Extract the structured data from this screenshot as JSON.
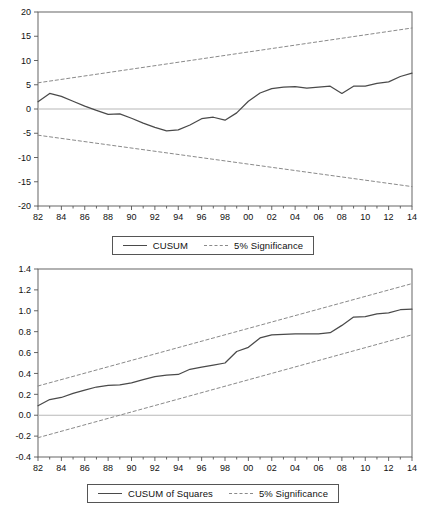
{
  "chart_data": [
    {
      "id": "cusum",
      "type": "line",
      "title": "",
      "xlabel": "",
      "ylabel": "",
      "xlim": [
        1982,
        2014
      ],
      "ylim": [
        -20,
        20
      ],
      "yticks": [
        "20",
        "15",
        "10",
        "5",
        "0",
        "-5",
        "-10",
        "-15",
        "-20"
      ],
      "ytick_values": [
        20,
        15,
        10,
        5,
        0,
        -5,
        -10,
        -15,
        -20
      ],
      "xticks": [
        "82",
        "84",
        "86",
        "88",
        "90",
        "92",
        "94",
        "96",
        "98",
        "00",
        "02",
        "04",
        "06",
        "08",
        "10",
        "12",
        "14"
      ],
      "xtick_values": [
        1982,
        1984,
        1986,
        1988,
        1990,
        1992,
        1994,
        1996,
        1998,
        2000,
        2002,
        2004,
        2006,
        2008,
        2010,
        2012,
        2014
      ],
      "grid": false,
      "zero_line": 0,
      "legend_position": "bottom",
      "series": [
        {
          "name": "CUSUM",
          "style": "solid",
          "color": "#4a4a4a",
          "x": [
            1982,
            1983,
            1984,
            1985,
            1986,
            1987,
            1988,
            1989,
            1990,
            1991,
            1992,
            1993,
            1994,
            1995,
            1996,
            1997,
            1998,
            1999,
            2000,
            2001,
            2002,
            2003,
            2004,
            2005,
            2006,
            2007,
            2008,
            2009,
            2010,
            2011,
            2012,
            2013,
            2014
          ],
          "values": [
            1.5,
            3.2,
            2.6,
            1.6,
            0.6,
            -0.3,
            -1.1,
            -1.0,
            -1.9,
            -2.9,
            -3.8,
            -4.5,
            -4.3,
            -3.3,
            -2.0,
            -1.7,
            -2.3,
            -0.8,
            1.6,
            3.3,
            4.2,
            4.5,
            4.6,
            4.3,
            4.5,
            4.7,
            3.2,
            4.7,
            4.7,
            5.3,
            5.6,
            6.7,
            7.4
          ]
        },
        {
          "name": "5% Significance",
          "style": "dashed",
          "color": "#8a8a8a",
          "x": [
            1982,
            2014
          ],
          "values": [
            5.4,
            16.7
          ]
        },
        {
          "name": "5% Significance",
          "style": "dashed",
          "color": "#8a8a8a",
          "x": [
            1982,
            2014
          ],
          "values": [
            -5.4,
            -16.0
          ]
        }
      ],
      "legend": [
        {
          "label": "CUSUM",
          "style": "solid"
        },
        {
          "label": "5% Significance",
          "style": "dashed"
        }
      ]
    },
    {
      "id": "cusum-squares",
      "type": "line",
      "title": "",
      "xlabel": "",
      "ylabel": "",
      "xlim": [
        1982,
        2014
      ],
      "ylim": [
        -0.4,
        1.4
      ],
      "yticks": [
        "1.4",
        "1.2",
        "1.0",
        "0.8",
        "0.6",
        "0.4",
        "0.2",
        "0.0",
        "-0.2",
        "-0.4"
      ],
      "ytick_values": [
        1.4,
        1.2,
        1.0,
        0.8,
        0.6,
        0.4,
        0.2,
        0.0,
        -0.2,
        -0.4
      ],
      "xticks": [
        "82",
        "84",
        "86",
        "88",
        "90",
        "92",
        "94",
        "96",
        "98",
        "00",
        "02",
        "04",
        "06",
        "08",
        "10",
        "12",
        "14"
      ],
      "xtick_values": [
        1982,
        1984,
        1986,
        1988,
        1990,
        1992,
        1994,
        1996,
        1998,
        2000,
        2002,
        2004,
        2006,
        2008,
        2010,
        2012,
        2014
      ],
      "grid": false,
      "zero_line": 0.0,
      "legend_position": "bottom",
      "series": [
        {
          "name": "CUSUM of Squares",
          "style": "solid",
          "color": "#4a4a4a",
          "x": [
            1982,
            1983,
            1984,
            1985,
            1986,
            1987,
            1988,
            1989,
            1990,
            1991,
            1992,
            1993,
            1994,
            1995,
            1996,
            1997,
            1998,
            1999,
            2000,
            2001,
            2002,
            2003,
            2004,
            2005,
            2006,
            2007,
            2008,
            2009,
            2010,
            2011,
            2012,
            2013,
            2014
          ],
          "values": [
            0.09,
            0.15,
            0.17,
            0.21,
            0.24,
            0.27,
            0.285,
            0.29,
            0.31,
            0.34,
            0.37,
            0.385,
            0.39,
            0.44,
            0.46,
            0.48,
            0.5,
            0.61,
            0.65,
            0.74,
            0.77,
            0.775,
            0.78,
            0.78,
            0.78,
            0.79,
            0.86,
            0.94,
            0.945,
            0.97,
            0.98,
            1.01,
            1.015
          ]
        },
        {
          "name": "5% Significance",
          "style": "dashed",
          "color": "#8a8a8a",
          "x": [
            1982,
            2014
          ],
          "values": [
            0.28,
            1.26
          ]
        },
        {
          "name": "5% Significance",
          "style": "dashed",
          "color": "#8a8a8a",
          "x": [
            1982,
            2014
          ],
          "values": [
            -0.215,
            0.77
          ]
        }
      ],
      "legend": [
        {
          "label": "CUSUM of Squares",
          "style": "solid"
        },
        {
          "label": "5% Significance",
          "style": "dashed"
        }
      ]
    }
  ],
  "colors": {
    "series_line": "#4a4a4a",
    "significance_line": "#8a8a8a",
    "axis": "#555555",
    "zero_line": "#b8b8b8",
    "text": "#111111",
    "background": "#ffffff"
  }
}
